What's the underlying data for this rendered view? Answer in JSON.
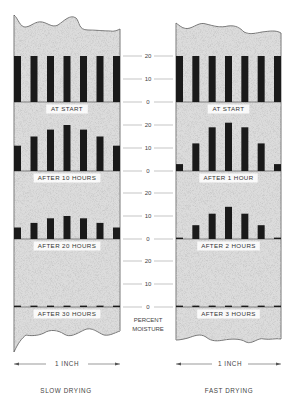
{
  "figure": {
    "axis_title_line1": "PERCENT",
    "axis_title_line2": "MOISTURE",
    "axis_ticks": [
      "20",
      "10",
      "0"
    ],
    "scale_label": "1 INCH",
    "colors": {
      "wood_fill": "#d9d9d9",
      "bar": "#1a1a1a",
      "label_bg": "#ffffff",
      "grid": "#888888"
    }
  },
  "left": {
    "caption": "SLOW DRYING",
    "scale_label": "1 INCH",
    "panels": [
      {
        "label": "AT START",
        "values": [
          20,
          20,
          20,
          20,
          20,
          20,
          20
        ]
      },
      {
        "label": "AFTER 10 HOURS",
        "values": [
          11,
          15,
          18,
          20,
          18,
          15,
          11
        ]
      },
      {
        "label": "AFTER 20 HOURS",
        "values": [
          5,
          7,
          9,
          10,
          9,
          7,
          5
        ]
      },
      {
        "label": "AFTER 30 HOURS",
        "values": [
          0.6,
          0.6,
          0.6,
          0.6,
          0.6,
          0.6,
          0.6
        ]
      }
    ]
  },
  "right": {
    "caption": "FAST DRYING",
    "scale_label": "1 INCH",
    "panels": [
      {
        "label": "AT START",
        "values": [
          20,
          20,
          20,
          20,
          20,
          20,
          20
        ]
      },
      {
        "label": "AFTER 1 HOUR",
        "values": [
          3,
          12,
          19,
          21,
          19,
          12,
          3
        ]
      },
      {
        "label": "AFTER 2 HOURS",
        "values": [
          0.6,
          6,
          11,
          14,
          11,
          6,
          0.6
        ]
      },
      {
        "label": "AFTER 3 HOURS",
        "values": [
          0.6,
          0.6,
          0.6,
          0.6,
          0.6,
          0.6,
          0.6
        ]
      }
    ]
  },
  "chart_data": {
    "type": "bar",
    "ylabel": "PERCENT MOISTURE",
    "ylim": [
      0,
      20
    ],
    "yticks": [
      0,
      10,
      20
    ],
    "categories": [
      "1",
      "2",
      "3",
      "4",
      "5",
      "6",
      "7"
    ],
    "series": [
      {
        "name": "SLOW DRYING - AT START",
        "values": [
          20,
          20,
          20,
          20,
          20,
          20,
          20
        ]
      },
      {
        "name": "SLOW DRYING - AFTER 10 HOURS",
        "values": [
          11,
          15,
          18,
          20,
          18,
          15,
          11
        ]
      },
      {
        "name": "SLOW DRYING - AFTER 20 HOURS",
        "values": [
          5,
          7,
          9,
          10,
          9,
          7,
          5
        ]
      },
      {
        "name": "SLOW DRYING - AFTER 30 HOURS",
        "values": [
          0.6,
          0.6,
          0.6,
          0.6,
          0.6,
          0.6,
          0.6
        ]
      },
      {
        "name": "FAST DRYING - AT START",
        "values": [
          20,
          20,
          20,
          20,
          20,
          20,
          20
        ]
      },
      {
        "name": "FAST DRYING - AFTER 1 HOUR",
        "values": [
          3,
          12,
          19,
          21,
          19,
          12,
          3
        ]
      },
      {
        "name": "FAST DRYING - AFTER 2 HOURS",
        "values": [
          0.6,
          6,
          11,
          14,
          11,
          6,
          0.6
        ]
      },
      {
        "name": "FAST DRYING - AFTER 3 HOURS",
        "values": [
          0.6,
          0.6,
          0.6,
          0.6,
          0.6,
          0.6,
          0.6
        ]
      }
    ],
    "xlabel": "1 INCH",
    "legend": [
      "SLOW DRYING",
      "FAST DRYING"
    ],
    "grid": false
  }
}
